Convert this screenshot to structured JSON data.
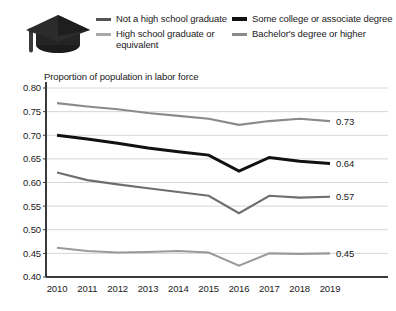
{
  "legend": {
    "icon": "graduation-cap-icon",
    "entries": [
      {
        "label": "Not a high school graduate",
        "color": "#555555",
        "weight": "normal",
        "column": "left"
      },
      {
        "label": "High school graduate or equivalent",
        "color": "#a8a8a8",
        "weight": "normal",
        "column": "left"
      },
      {
        "label": "Some college or associate degree",
        "color": "#111111",
        "weight": "thick",
        "column": "right"
      },
      {
        "label": "Bachelor's degree or higher",
        "color": "#8a8a8a",
        "weight": "normal",
        "column": "right"
      }
    ]
  },
  "chart_data": {
    "type": "line",
    "title": "Proportion of population in labor force",
    "xlabel": "",
    "ylabel": "",
    "x": [
      2010,
      2011,
      2012,
      2013,
      2014,
      2015,
      2016,
      2017,
      2018,
      2019
    ],
    "categories": [
      "2010",
      "2011",
      "2012",
      "2013",
      "2014",
      "2015",
      "2016",
      "2017",
      "2018",
      "2019"
    ],
    "ylim": [
      0.4,
      0.8
    ],
    "yticks": [
      "0.80",
      "0.75",
      "0.70",
      "0.65",
      "0.60",
      "0.55",
      "0.50",
      "0.45",
      "0.40"
    ],
    "ytick_values": [
      0.8,
      0.75,
      0.7,
      0.65,
      0.6,
      0.55,
      0.5,
      0.45,
      0.4
    ],
    "grid": true,
    "legend_position": "top",
    "series": [
      {
        "name": "Bachelor's degree or higher",
        "color": "#8a8a8a",
        "width": 2.1,
        "values": [
          0.768,
          0.761,
          0.755,
          0.747,
          0.741,
          0.735,
          0.722,
          0.73,
          0.735,
          0.73
        ],
        "end_label": "0.73"
      },
      {
        "name": "Some college or associate degree",
        "color": "#111111",
        "width": 3.0,
        "values": [
          0.7,
          0.692,
          0.683,
          0.673,
          0.665,
          0.658,
          0.624,
          0.653,
          0.645,
          0.64
        ],
        "end_label": "0.64"
      },
      {
        "name": "Not a high school graduate",
        "color": "#6e6e6e",
        "width": 2.1,
        "values": [
          0.621,
          0.605,
          0.596,
          0.588,
          0.58,
          0.572,
          0.535,
          0.572,
          0.568,
          0.57
        ],
        "end_label": "0.57"
      },
      {
        "name": "High school graduate or equivalent",
        "color": "#9a9a9a",
        "width": 2.1,
        "values": [
          0.462,
          0.455,
          0.452,
          0.453,
          0.455,
          0.452,
          0.424,
          0.45,
          0.449,
          0.45
        ],
        "end_label": "0.45"
      }
    ]
  },
  "colors": {
    "axis": "#3a3a3a",
    "grid": "#cccccc",
    "background": "#ffffff",
    "text": "#1a1a1a"
  }
}
